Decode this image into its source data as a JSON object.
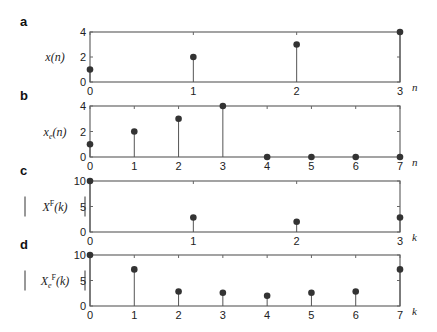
{
  "figure": {
    "stem_color": "#555555",
    "marker_color": "#333333",
    "axis_color": "#666666"
  },
  "chart_data": [
    {
      "type": "stem",
      "panel": "a",
      "ylabel": "x(n)",
      "xlabel": "n",
      "x": [
        0,
        1,
        2,
        3
      ],
      "values": [
        1,
        2,
        3,
        4
      ],
      "xlim": [
        0,
        3
      ],
      "ylim": [
        0,
        4
      ],
      "xticks": [
        "0",
        "1",
        "2",
        "3"
      ],
      "yticks": [
        "0",
        "2",
        "4"
      ],
      "box": {
        "left": 90,
        "top": 32,
        "right": 400,
        "bottom": 82
      }
    },
    {
      "type": "stem",
      "panel": "b",
      "ylabel": "xe(n)",
      "xlabel": "n",
      "x": [
        0,
        1,
        2,
        3,
        4,
        5,
        6,
        7
      ],
      "values": [
        1,
        2,
        3,
        4,
        0,
        0,
        0,
        0
      ],
      "xlim": [
        0,
        7
      ],
      "ylim": [
        0,
        4
      ],
      "xticks": [
        "0",
        "1",
        "2",
        "3",
        "4",
        "5",
        "6",
        "7"
      ],
      "yticks": [
        "0",
        "2",
        "4"
      ],
      "box": {
        "left": 90,
        "top": 106,
        "right": 400,
        "bottom": 157
      }
    },
    {
      "type": "stem",
      "panel": "c",
      "ylabel": "|X^F(k)|",
      "xlabel": "k",
      "x": [
        0,
        1,
        2,
        3
      ],
      "values": [
        10,
        2.83,
        2,
        2.83
      ],
      "xlim": [
        0,
        3
      ],
      "ylim": [
        0,
        10
      ],
      "xticks": [
        "0",
        "1",
        "2",
        "3"
      ],
      "yticks": [
        "0",
        "5",
        "10"
      ],
      "box": {
        "left": 90,
        "top": 181,
        "right": 400,
        "bottom": 232
      }
    },
    {
      "type": "stem",
      "panel": "d",
      "ylabel": "|Xe^F(k)|",
      "xlabel": "k",
      "x": [
        0,
        1,
        2,
        3,
        4,
        5,
        6,
        7
      ],
      "values": [
        10,
        7.18,
        2.83,
        2.59,
        2,
        2.59,
        2.83,
        7.18
      ],
      "xlim": [
        0,
        7
      ],
      "ylim": [
        0,
        10
      ],
      "xticks": [
        "0",
        "1",
        "2",
        "3",
        "4",
        "5",
        "6",
        "7"
      ],
      "yticks": [
        "0",
        "5",
        "10"
      ],
      "box": {
        "left": 90,
        "top": 255,
        "right": 400,
        "bottom": 306
      }
    }
  ]
}
